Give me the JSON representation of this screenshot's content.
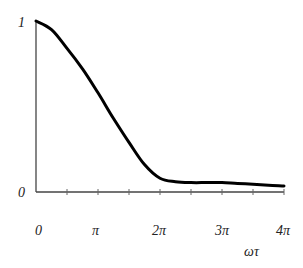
{
  "chart_data": {
    "type": "line",
    "title": "",
    "xlabel": "ωτ",
    "ylabel": "",
    "x_tick_labels": [
      "0",
      "π",
      "2π",
      "3π",
      "4π"
    ],
    "y_tick_labels": [
      "0",
      "1"
    ],
    "xlim": [
      0,
      12.566
    ],
    "ylim": [
      0,
      1
    ],
    "grid": false,
    "legend": null,
    "series": [
      {
        "name": "curve",
        "x": [
          0,
          0.785,
          1.571,
          2.356,
          3.142,
          3.927,
          4.712,
          5.498,
          6.283,
          7.069,
          7.854,
          8.639,
          9.425,
          10.21,
          10.996,
          11.781,
          12.566
        ],
        "values": [
          1.0,
          0.95,
          0.84,
          0.72,
          0.58,
          0.43,
          0.29,
          0.16,
          0.08,
          0.06,
          0.055,
          0.055,
          0.055,
          0.05,
          0.045,
          0.04,
          0.035
        ]
      }
    ]
  },
  "labels": {
    "y_top": "1",
    "y_bottom": "0",
    "x0": "0",
    "x1": "π",
    "x2": "2π",
    "x3": "3π",
    "x4": "4π",
    "xaxis": "ωτ"
  },
  "colors": {
    "curve": "#000000",
    "axis": "#444444"
  }
}
